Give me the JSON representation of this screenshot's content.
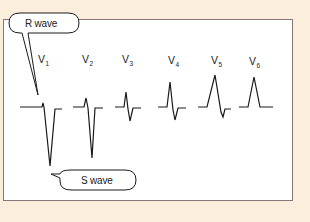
{
  "diagram": {
    "background_color": "#fbeedd",
    "panel_color": "#ffffff",
    "border_color": "#8a7878",
    "line_color": "#1a1a1a",
    "leads": [
      {
        "name": "V",
        "sub": "1"
      },
      {
        "name": "V",
        "sub": "2"
      },
      {
        "name": "V",
        "sub": "3"
      },
      {
        "name": "V",
        "sub": "4"
      },
      {
        "name": "V",
        "sub": "5"
      },
      {
        "name": "V",
        "sub": "6"
      }
    ],
    "callouts": {
      "r_wave": "R wave",
      "s_wave": "S wave"
    }
  }
}
